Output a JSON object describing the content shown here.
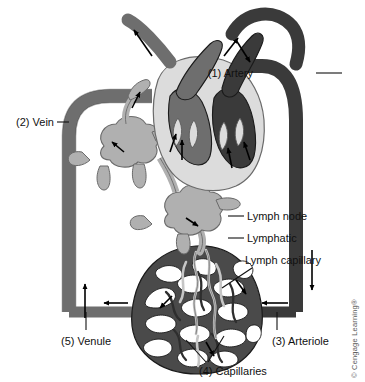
{
  "figure": {
    "credit": "© Cengage Learning®"
  },
  "labels": {
    "artery": "(1) Artery",
    "vein": "(2) Vein",
    "arteriole": "(3) Arteriole",
    "capillaries": "(4) Capillaries",
    "venule": "(5) Venule",
    "lymph_node": "Lymph node",
    "lymphatic": "Lymphatic",
    "lymph_capillary": "Lymph capillary"
  },
  "colors": {
    "artery_dark": "#3a3a3a",
    "vein_medium": "#6e6e6e",
    "lymph_light": "#b0b0b0",
    "heart_outline": "#d2d2d2",
    "outline": "#1a1a1a",
    "background": "#ffffff",
    "text": "#111111"
  },
  "structures": [
    {
      "name": "artery",
      "tone": "dark",
      "flow": "down"
    },
    {
      "name": "vein",
      "tone": "medium",
      "flow": "up"
    },
    {
      "name": "arteriole",
      "tone": "dark",
      "flow": "left"
    },
    {
      "name": "venule",
      "tone": "medium",
      "flow": "left"
    },
    {
      "name": "capillary-bed",
      "tone": "dark",
      "flow": "mesh"
    },
    {
      "name": "lymph-node-upper",
      "tone": "light",
      "flow": "up"
    },
    {
      "name": "lymph-node-lower",
      "tone": "light",
      "flow": "up"
    },
    {
      "name": "lymph-capillary",
      "tone": "light",
      "flow": "up"
    },
    {
      "name": "heart",
      "tone": "mixed",
      "flow": "circuit"
    }
  ]
}
